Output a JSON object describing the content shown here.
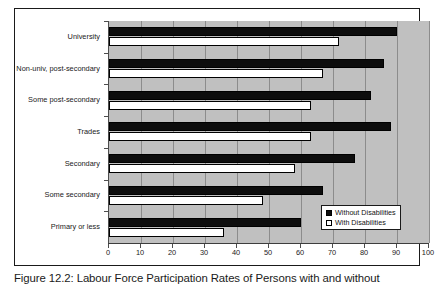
{
  "figure": {
    "caption": "Figure 12.2: Labour Force Participation Rates of Persons with and without"
  },
  "legend": {
    "position": "bottom-right",
    "items": [
      {
        "label": "Without Disabilities",
        "swatch": "filled-square-icon"
      },
      {
        "label": "With Disabilities",
        "swatch": "open-square-icon"
      }
    ]
  },
  "colors": {
    "plot_background": "#c0c0c0",
    "without_disabilities": "#0d0d0d",
    "with_disabilities": "#ffffff",
    "gridline": "#8c8c8c",
    "axis": "#3d3d3d",
    "frame": "#1a1a1a"
  },
  "chart_data": {
    "type": "bar",
    "orientation": "horizontal",
    "title": "",
    "xlabel": "",
    "ylabel": "",
    "xlim": [
      0,
      100
    ],
    "xticks": [
      0,
      10,
      20,
      30,
      40,
      50,
      60,
      70,
      80,
      90,
      100
    ],
    "xtick_labels": [
      "0",
      "10",
      "20",
      "30",
      "40",
      "50",
      "60",
      "70",
      "80",
      "90",
      "100"
    ],
    "grid": true,
    "grid_axis": "x",
    "legend_position": "lower right",
    "categories": [
      "University",
      "Non-univ, post-secondary",
      "Some post-secondary",
      "Trades",
      "Secondary",
      "Some secondary",
      "Primary or less"
    ],
    "series": [
      {
        "name": "Without Disabilities",
        "values": [
          90,
          86,
          82,
          88,
          77,
          67,
          60
        ]
      },
      {
        "name": "With Disabilities",
        "values": [
          72,
          67,
          63,
          63,
          58,
          48,
          36
        ]
      }
    ]
  }
}
